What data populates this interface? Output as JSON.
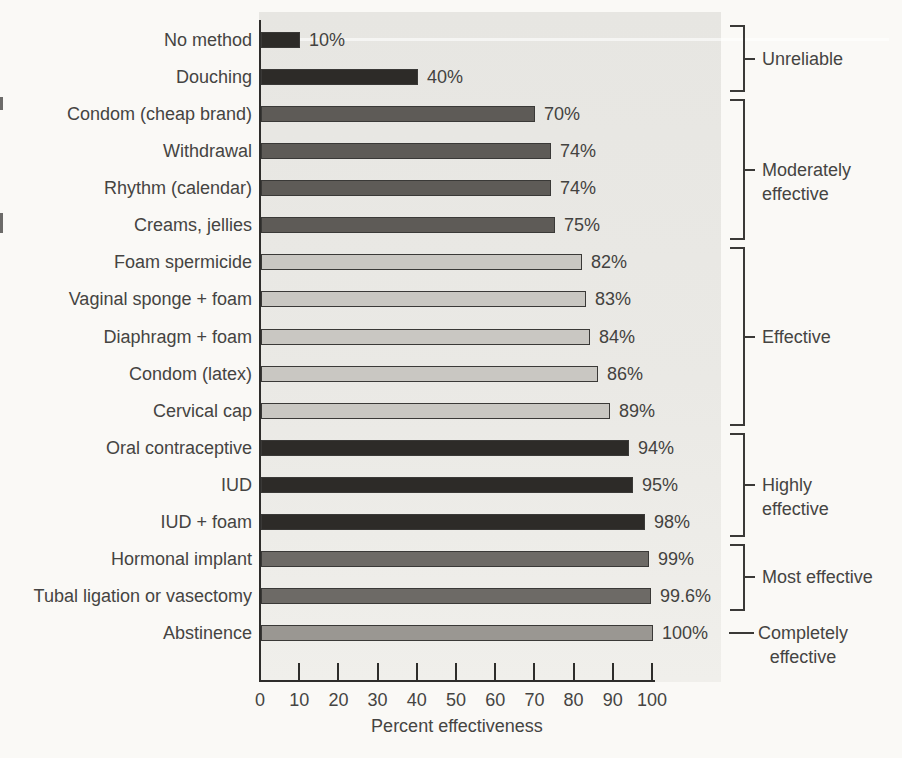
{
  "figure": {
    "page_background": "#faf9f6",
    "plot_background": "#e9e8e4",
    "axis_color": "#2e2d2b",
    "text_color": "#454442"
  },
  "chart_data": {
    "type": "bar",
    "orientation": "horizontal",
    "title": "",
    "xlabel": "Percent effectiveness",
    "ylabel": "",
    "xlim": [
      0,
      100
    ],
    "grid": false,
    "x_ticks": [
      0,
      10,
      20,
      30,
      40,
      50,
      60,
      70,
      80,
      90,
      100
    ],
    "categories": [
      "No method",
      "Douching",
      "Condom (cheap brand)",
      "Withdrawal",
      "Rhythm (calendar)",
      "Creams, jellies",
      "Foam spermicide",
      "Vaginal sponge + foam",
      "Diaphragm + foam",
      "Condom (latex)",
      "Cervical cap",
      "Oral contraceptive",
      "IUD",
      "IUD + foam",
      "Hormonal implant",
      "Tubal ligation or vasectomy",
      "Abstinence"
    ],
    "values": [
      10,
      40,
      70,
      74,
      74,
      75,
      82,
      83,
      84,
      86,
      89,
      94,
      95,
      98,
      99,
      99.6,
      100
    ],
    "value_labels": [
      "10%",
      "40%",
      "70%",
      "74%",
      "74%",
      "75%",
      "82%",
      "83%",
      "84%",
      "86%",
      "89%",
      "94%",
      "95%",
      "98%",
      "99%",
      "99.6%",
      "100%"
    ],
    "groups": [
      {
        "label": "Unreliable",
        "lines": [
          "Unreliable"
        ],
        "first_row": 0,
        "last_row": 1,
        "bar_color": "#2d2b28",
        "bracket": true,
        "align": "left"
      },
      {
        "label": "Moderately effective",
        "lines": [
          "Moderately",
          "effective"
        ],
        "first_row": 2,
        "last_row": 5,
        "bar_color": "#5e5b57",
        "bracket": true,
        "align": "left"
      },
      {
        "label": "Effective",
        "lines": [
          "Effective"
        ],
        "first_row": 6,
        "last_row": 10,
        "bar_color": "#c9c7c2",
        "bracket": true,
        "align": "left"
      },
      {
        "label": "Highly effective",
        "lines": [
          "Highly",
          "effective"
        ],
        "first_row": 11,
        "last_row": 13,
        "bar_color": "#2d2b28",
        "bracket": true,
        "align": "left"
      },
      {
        "label": "Most effective",
        "lines": [
          "Most effective"
        ],
        "first_row": 14,
        "last_row": 15,
        "bar_color": "#6d6a66",
        "bracket": true,
        "align": "left"
      },
      {
        "label": "Completely effective",
        "lines": [
          "Completely",
          "effective"
        ],
        "first_row": 16,
        "last_row": 16,
        "bar_color": "#9a9792",
        "bracket": false,
        "align": "center"
      }
    ],
    "legend": null
  }
}
